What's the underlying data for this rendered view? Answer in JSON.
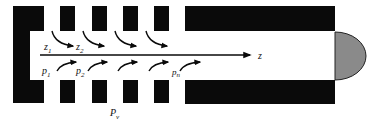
{
  "diagram": {
    "type": "cross-section schematic",
    "colors": {
      "solid": "#0a0a0a",
      "cap_fill": "#8a8a8a",
      "cap_stroke": "#222222",
      "background": "#ffffff"
    },
    "axis": {
      "label": "z"
    },
    "labels": {
      "z1": {
        "main": "z",
        "sub": "1"
      },
      "z2": {
        "main": "z",
        "sub": "2"
      },
      "p1": {
        "main": "p",
        "sub": "1"
      },
      "p2": {
        "main": "p",
        "sub": "2"
      },
      "pn": {
        "main": "p",
        "sub": "n"
      },
      "pv": {
        "main": "P",
        "sub": "v"
      }
    },
    "upper_slots": 4,
    "lower_slots": 4,
    "upper_flow_arrows": 4,
    "lower_flow_arrows": 5
  }
}
